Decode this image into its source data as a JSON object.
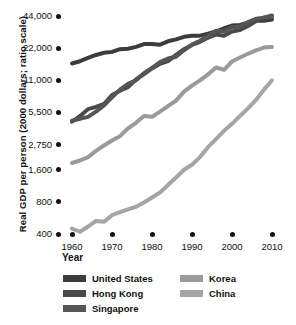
{
  "chart_data": {
    "type": "line",
    "title": "",
    "xlabel": "Year",
    "ylabel": "Real GDP per person (2000 dollars; ratio scale)",
    "scale": "log",
    "grid": false,
    "legend_position": "bottom",
    "xlim": [
      1960,
      2010
    ],
    "ylim": [
      400,
      44000
    ],
    "xticks": [
      "1960",
      "1970",
      "1980",
      "1990",
      "2000",
      "2010"
    ],
    "xtick_values": [
      1960,
      1970,
      1980,
      1990,
      2000,
      2010
    ],
    "yticks": [
      "44,000",
      "22,000",
      "11,000",
      "5,500",
      "2,750",
      "1,600",
      "800",
      "400"
    ],
    "ytick_values": [
      44000,
      22000,
      11000,
      5500,
      2750,
      1600,
      800,
      400
    ],
    "x": [
      1960,
      1962,
      1964,
      1966,
      1968,
      1970,
      1972,
      1974,
      1976,
      1978,
      1980,
      1982,
      1984,
      1986,
      1988,
      1990,
      1992,
      1994,
      1996,
      1998,
      2000,
      2002,
      2004,
      2006,
      2008,
      2010
    ],
    "series": [
      {
        "name": "United States",
        "color": "#3c3c3c",
        "values": [
          15800,
          16600,
          17800,
          19000,
          19900,
          20300,
          21500,
          21700,
          22600,
          24000,
          24100,
          23700,
          25500,
          26600,
          28100,
          28800,
          28800,
          30000,
          31500,
          33800,
          35800,
          36200,
          38000,
          39700,
          39800,
          40800
        ]
      },
      {
        "name": "Hong Kong",
        "color": "#4a4a4a",
        "values": [
          4500,
          5100,
          5900,
          6200,
          6600,
          8000,
          8800,
          9500,
          11200,
          12600,
          14200,
          15700,
          16600,
          19000,
          21500,
          23600,
          25200,
          27600,
          29500,
          28800,
          31500,
          32500,
          35500,
          39500,
          42500,
          44500
        ]
      },
      {
        "name": "Singapore",
        "color": "#555555",
        "values": [
          4600,
          4800,
          5000,
          5600,
          6400,
          7600,
          9000,
          10200,
          11000,
          12800,
          14400,
          16300,
          17600,
          18300,
          21000,
          23800,
          25800,
          28600,
          32000,
          31500,
          34500,
          35000,
          38500,
          41500,
          42500,
          43000
        ]
      },
      {
        "name": "Korea",
        "color": "#9a9a9a",
        "values": [
          1850,
          1950,
          2100,
          2400,
          2700,
          3000,
          3300,
          3900,
          4400,
          5100,
          5000,
          5600,
          6300,
          7100,
          8600,
          9800,
          11000,
          12500,
          14500,
          13800,
          16500,
          18000,
          19500,
          21000,
          22300,
          22600
        ]
      },
      {
        "name": "China",
        "color": "#a5a5a5",
        "values": [
          450,
          420,
          470,
          530,
          520,
          600,
          640,
          680,
          720,
          790,
          880,
          980,
          1150,
          1350,
          1600,
          1780,
          2100,
          2600,
          3100,
          3700,
          4300,
          5100,
          6000,
          7200,
          9000,
          11000
        ]
      }
    ]
  },
  "legend": {
    "columns": [
      {
        "items": [
          {
            "label": "United States",
            "color": "#3c3c3c"
          },
          {
            "label": "Hong Kong",
            "color": "#4a4a4a"
          },
          {
            "label": "Singapore",
            "color": "#555555"
          }
        ]
      },
      {
        "items": [
          {
            "label": "Korea",
            "color": "#9a9a9a"
          },
          {
            "label": "China",
            "color": "#a5a5a5"
          }
        ]
      }
    ]
  }
}
